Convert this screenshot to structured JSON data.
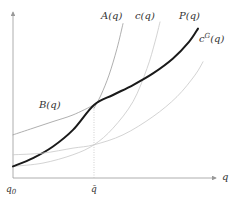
{
  "chart_data": {
    "type": "line",
    "title": "",
    "xlabel": "q",
    "ylabel": "",
    "xlim": [
      0,
      1
    ],
    "ylim": [
      0,
      1
    ],
    "grid": false,
    "x_ticks": [
      {
        "value": 0,
        "label": "q0"
      },
      {
        "value": 0.405,
        "label": "q̄"
      }
    ],
    "reference_lines": [
      {
        "x": 0.405,
        "style": "dotted"
      }
    ],
    "series": [
      {
        "name": "A(q)",
        "label": "A(q)",
        "color": "#9a9a9a",
        "width": 0.8,
        "points": [
          [
            0.405,
            0.42
          ],
          [
            0.44,
            0.5
          ],
          [
            0.48,
            0.62
          ],
          [
            0.52,
            0.78
          ],
          [
            0.55,
            0.93
          ]
        ]
      },
      {
        "name": "B(q)",
        "label": "B(q)",
        "color": "#9a9a9a",
        "width": 0.8,
        "points": [
          [
            0,
            0.26
          ],
          [
            0.1,
            0.3
          ],
          [
            0.2,
            0.34
          ],
          [
            0.3,
            0.38
          ],
          [
            0.405,
            0.44
          ]
        ]
      },
      {
        "name": "c(q)",
        "label": "c(q)",
        "color": "#c8c8c8",
        "width": 0.8,
        "points": [
          [
            0,
            0.07
          ],
          [
            0.15,
            0.09
          ],
          [
            0.3,
            0.14
          ],
          [
            0.405,
            0.2
          ],
          [
            0.5,
            0.3
          ],
          [
            0.6,
            0.46
          ],
          [
            0.67,
            0.66
          ],
          [
            0.71,
            0.82
          ],
          [
            0.735,
            0.94
          ]
        ]
      },
      {
        "name": "P(q)",
        "label": "P(q)",
        "color": "#1a1a1a",
        "width": 2,
        "points": [
          [
            0,
            0.07
          ],
          [
            0.1,
            0.12
          ],
          [
            0.2,
            0.19
          ],
          [
            0.3,
            0.29
          ],
          [
            0.405,
            0.44
          ],
          [
            0.5,
            0.5
          ],
          [
            0.6,
            0.56
          ],
          [
            0.7,
            0.63
          ],
          [
            0.8,
            0.72
          ],
          [
            0.88,
            0.82
          ],
          [
            0.925,
            0.9
          ]
        ]
      },
      {
        "name": "cG(q)",
        "label": "c^G(q)",
        "color": "#c8c8c8",
        "width": 0.8,
        "points": [
          [
            0,
            0.14
          ],
          [
            0.15,
            0.15
          ],
          [
            0.3,
            0.18
          ],
          [
            0.405,
            0.2
          ],
          [
            0.55,
            0.26
          ],
          [
            0.7,
            0.37
          ],
          [
            0.82,
            0.49
          ],
          [
            0.91,
            0.62
          ],
          [
            0.95,
            0.7
          ]
        ]
      }
    ],
    "annotations": [
      {
        "text": "A(q)",
        "at": [
          0.44,
          0.96
        ]
      },
      {
        "text": "c(q)",
        "at": [
          0.61,
          0.96
        ]
      },
      {
        "text": "P(q)",
        "at": [
          0.83,
          0.96
        ]
      },
      {
        "text": "c^G(q)",
        "at": [
          0.93,
          0.82
        ]
      },
      {
        "text": "B(q)",
        "at": [
          0.13,
          0.42
        ]
      }
    ]
  }
}
